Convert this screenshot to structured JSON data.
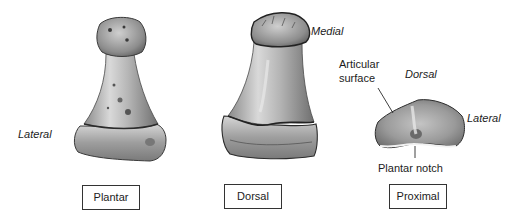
{
  "figure": {
    "views": [
      {
        "id": "plantar",
        "caption": "Plantar"
      },
      {
        "id": "dorsal",
        "caption": "Dorsal"
      },
      {
        "id": "proximal",
        "caption": "Proximal"
      }
    ],
    "annotations": {
      "plantar_lateral": "Lateral",
      "dorsal_medial": "Medial",
      "proximal_articular_line1": "Articular",
      "proximal_articular_line2": "surface",
      "proximal_dorsal": "Dorsal",
      "proximal_lateral": "Lateral",
      "proximal_plantar_notch": "Plantar notch"
    },
    "colors": {
      "bone_light": "#e4e4e4",
      "bone_mid": "#a9a9a9",
      "bone_dark": "#555555",
      "outline": "#2b2b2b",
      "box_border": "#333333"
    }
  }
}
